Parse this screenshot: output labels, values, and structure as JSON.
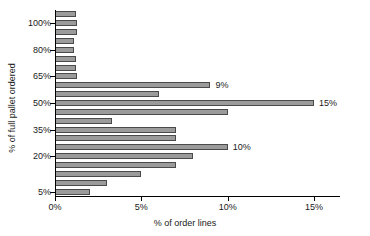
{
  "chart_data": {
    "type": "bar",
    "orientation": "horizontal",
    "title": "",
    "xlabel": "% of order lines",
    "ylabel": "% of full pallet ordered",
    "xlim": [
      0,
      16.5
    ],
    "ylim": [
      0,
      22
    ],
    "grid": false,
    "legend": null,
    "xtick_labels": [
      "0%",
      "5%",
      "10%",
      "15%"
    ],
    "xtick_values": [
      0,
      5,
      10,
      15
    ],
    "ytick_labels": [
      "5%",
      "20%",
      "35%",
      "50%",
      "65%",
      "80%",
      "100%"
    ],
    "bar_color": "#9b9b9b",
    "bar_edge_color": "#4a4a4a",
    "categories": [
      "100%",
      "95%",
      "90%",
      "85%",
      "80%",
      "75%",
      "70%",
      "65%",
      "60%",
      "55%",
      "50%",
      "45%",
      "40%",
      "35%",
      "30%",
      "25%",
      "20%",
      "15%",
      "10%",
      "5%",
      "2%"
    ],
    "values": [
      1.2,
      1.3,
      1.3,
      1.1,
      1.1,
      1.2,
      1.2,
      1.3,
      9.0,
      6.0,
      15.0,
      10.0,
      3.3,
      7.0,
      7.0,
      10.0,
      8.0,
      7.0,
      5.0,
      3.0,
      2.0
    ],
    "data_labels": [
      {
        "index": 8,
        "text": "9%"
      },
      {
        "index": 10,
        "text": "15%"
      },
      {
        "index": 15,
        "text": "10%"
      }
    ],
    "labeled_ytick_indices": [
      0,
      4,
      7,
      10,
      13,
      16,
      19
    ]
  }
}
